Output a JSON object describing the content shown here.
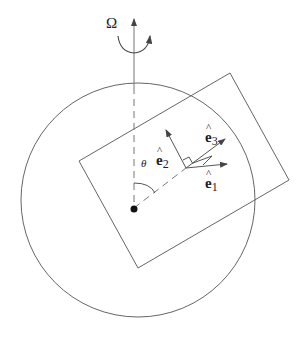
{
  "diagram": {
    "axis_label": "Ω",
    "angle_label": "θ",
    "vectors": [
      {
        "id": "e1",
        "hat": "^",
        "base": "e",
        "sub": "1"
      },
      {
        "id": "e2",
        "hat": "^",
        "base": "e",
        "sub": "2"
      },
      {
        "id": "e3",
        "hat": "^",
        "base": "e",
        "sub": "3"
      }
    ],
    "colors": {
      "stroke": "#555555",
      "ink": "#222222",
      "background": "#ffffff"
    }
  }
}
